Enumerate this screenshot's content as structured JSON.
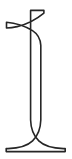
{
  "image": {
    "kind": "glyph-illustration",
    "subject": "numeral-one",
    "character": "1",
    "style": "outlined serif digit",
    "width_px": 72,
    "height_px": 159,
    "background_color": "#ffffff",
    "stroke_color": "#262626",
    "fill_color": "#ffffff",
    "alt_text": "Outline drawing of the serif numeral 1"
  },
  "glyph": {
    "label": "1",
    "parts": [
      {
        "name": "flag",
        "description": "angled upper-left flag tapering to a point"
      },
      {
        "name": "apex",
        "description": "top right corner of the stem"
      },
      {
        "name": "stem",
        "description": "tall vertical stroke"
      },
      {
        "name": "foot-serif",
        "description": "wide flared horizontal base serif"
      }
    ],
    "geometry": {
      "flag_tip_x": 6,
      "flag_tip_y": 22,
      "apex_x": 44,
      "apex_y": 10,
      "stem_left_x": 28,
      "stem_right_x": 44,
      "baseline_y": 151,
      "foot_left_x": 6,
      "foot_right_x": 65
    }
  }
}
